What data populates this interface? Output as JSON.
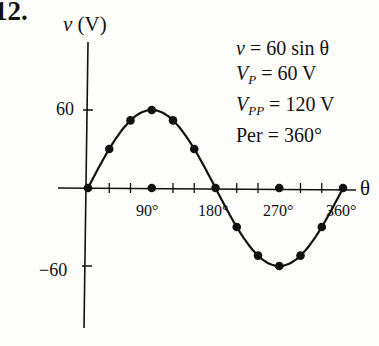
{
  "problem_number": "12.",
  "chart_data": {
    "type": "line",
    "title": "",
    "xlabel": "θ",
    "ylabel": "v (V)",
    "ylabel_var": "v",
    "ylabel_unit": "(V)",
    "x_unit": "degrees",
    "x": [
      0,
      30,
      60,
      90,
      120,
      150,
      180,
      210,
      240,
      270,
      300,
      330,
      360
    ],
    "series": [
      {
        "name": "v = 60 sin θ",
        "values": [
          0,
          30,
          52,
          60,
          52,
          30,
          0,
          -30,
          -52,
          -60,
          -52,
          -30,
          0
        ],
        "markers": true
      }
    ],
    "x_tick_labels": [
      "90°",
      "180°",
      "270°",
      "360°"
    ],
    "y_tick_labels": [
      "60",
      "−60"
    ],
    "ylim": [
      -75,
      85
    ],
    "xlim": [
      0,
      375
    ],
    "grid": false,
    "annotations": [
      {
        "var": "v",
        "text": " = 60 sin θ"
      },
      {
        "var": "V",
        "sub": "P",
        "text": " = 60 V"
      },
      {
        "var": "V",
        "sub": "PP",
        "text": " = 120 V"
      },
      {
        "var": "",
        "text": "Per = 360°"
      }
    ]
  }
}
